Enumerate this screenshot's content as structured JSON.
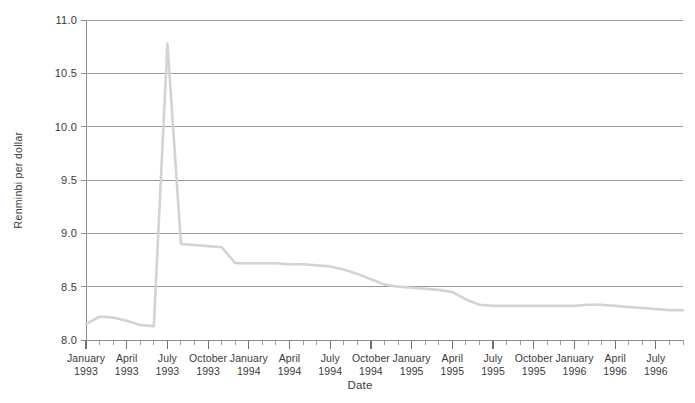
{
  "chart_data": {
    "type": "line",
    "title": "",
    "xlabel": "Date",
    "ylabel": "Renminbi per dollar",
    "ylim": [
      8.0,
      11.0
    ],
    "ytick_labels": [
      "8.0",
      "8.5",
      "9.0",
      "9.5",
      "10.0",
      "10.5",
      "11.0"
    ],
    "ytick_values": [
      8.0,
      8.5,
      9.0,
      9.5,
      10.0,
      10.5,
      11.0
    ],
    "grid": "horizontal",
    "legend": "none",
    "xlim": [
      "1993-01",
      "1996-09"
    ],
    "xtick_labels": [
      "January\n1993",
      "April\n1993",
      "July\n1993",
      "October\n1993",
      "January\n1994",
      "April\n1994",
      "July\n1994",
      "October\n1994",
      "January\n1995",
      "April\n1995",
      "July\n1995",
      "October\n1995",
      "January\n1996",
      "April\n1996",
      "July\n1996"
    ],
    "xtick_major": [
      {
        "label_month": "January",
        "label_year": "1993",
        "index": 0
      },
      {
        "label_month": "April",
        "label_year": "1993",
        "index": 3
      },
      {
        "label_month": "July",
        "label_year": "1993",
        "index": 6
      },
      {
        "label_month": "October",
        "label_year": "1993",
        "index": 9
      },
      {
        "label_month": "January",
        "label_year": "1994",
        "index": 12
      },
      {
        "label_month": "April",
        "label_year": "1994",
        "index": 15
      },
      {
        "label_month": "July",
        "label_year": "1994",
        "index": 18
      },
      {
        "label_month": "October",
        "label_year": "1994",
        "index": 21
      },
      {
        "label_month": "January",
        "label_year": "1995",
        "index": 24
      },
      {
        "label_month": "April",
        "label_year": "1995",
        "index": 27
      },
      {
        "label_month": "July",
        "label_year": "1995",
        "index": 30
      },
      {
        "label_month": "October",
        "label_year": "1995",
        "index": 33
      },
      {
        "label_month": "January",
        "label_year": "1996",
        "index": 36
      },
      {
        "label_month": "April",
        "label_year": "1996",
        "index": 39
      },
      {
        "label_month": "July",
        "label_year": "1996",
        "index": 42
      }
    ],
    "n_points": 45,
    "x": [
      "1993-01",
      "1993-02",
      "1993-03",
      "1993-04",
      "1993-05",
      "1993-06",
      "1993-07",
      "1993-08",
      "1993-09",
      "1993-10",
      "1993-11",
      "1993-12",
      "1994-01",
      "1994-02",
      "1994-03",
      "1994-04",
      "1994-05",
      "1994-06",
      "1994-07",
      "1994-08",
      "1994-09",
      "1994-10",
      "1994-11",
      "1994-12",
      "1995-01",
      "1995-02",
      "1995-03",
      "1995-04",
      "1995-05",
      "1995-06",
      "1995-07",
      "1995-08",
      "1995-09",
      "1995-10",
      "1995-11",
      "1995-12",
      "1996-01",
      "1996-02",
      "1996-03",
      "1996-04",
      "1996-05",
      "1996-06",
      "1996-07",
      "1996-08",
      "1996-09"
    ],
    "values": [
      8.15,
      8.22,
      8.21,
      8.18,
      8.14,
      8.13,
      10.78,
      8.9,
      8.89,
      8.88,
      8.87,
      8.72,
      8.72,
      8.72,
      8.72,
      8.71,
      8.71,
      8.7,
      8.69,
      8.66,
      8.62,
      8.57,
      8.52,
      8.5,
      8.49,
      8.48,
      8.47,
      8.45,
      8.38,
      8.33,
      8.32,
      8.32,
      8.32,
      8.32,
      8.32,
      8.32,
      8.32,
      8.33,
      8.33,
      8.32,
      8.31,
      8.3,
      8.29,
      8.28,
      8.28
    ],
    "series": [
      {
        "name": "Renminbi per dollar",
        "color": "#d3d3d3",
        "values": [
          8.15,
          8.22,
          8.21,
          8.18,
          8.14,
          8.13,
          10.78,
          8.9,
          8.89,
          8.88,
          8.87,
          8.72,
          8.72,
          8.72,
          8.72,
          8.71,
          8.71,
          8.7,
          8.69,
          8.66,
          8.62,
          8.57,
          8.52,
          8.5,
          8.49,
          8.48,
          8.47,
          8.45,
          8.38,
          8.33,
          8.32,
          8.32,
          8.32,
          8.32,
          8.32,
          8.32,
          8.32,
          8.33,
          8.33,
          8.32,
          8.31,
          8.3,
          8.29,
          8.28,
          8.28
        ]
      }
    ],
    "annotations": [
      "Sharp devaluation spike peaking near 10.78 in mid-1993",
      "Unification of exchange rates in January 1994 near 8.7",
      "Gradual appreciation to about 8.28 by late 1996"
    ]
  },
  "axes": {
    "y_title": "Renminbi per dollar",
    "x_title": "Date"
  }
}
